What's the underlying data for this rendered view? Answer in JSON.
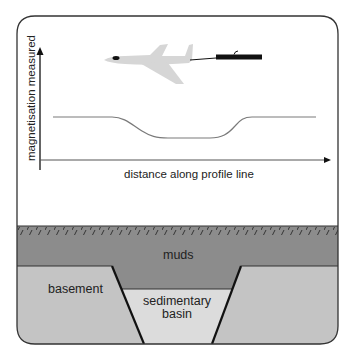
{
  "diagram": {
    "y_axis_label": "magnetisation measured",
    "x_axis_label": "distance along profile line",
    "layers": {
      "muds": "muds",
      "basement": "basement",
      "basin_line1": "sedimentary",
      "basin_line2": "basin"
    },
    "icons": {
      "aircraft": "aircraft-icon",
      "magnetometer": "magnetometer-icon"
    },
    "colors": {
      "muds": "#8c8c8c",
      "basement": "#c4c4c4",
      "basin": "#dcdcdc",
      "aircraft": "#d6d6d6",
      "profile_curve": "#7a7a7a",
      "outline": "#333333"
    }
  }
}
